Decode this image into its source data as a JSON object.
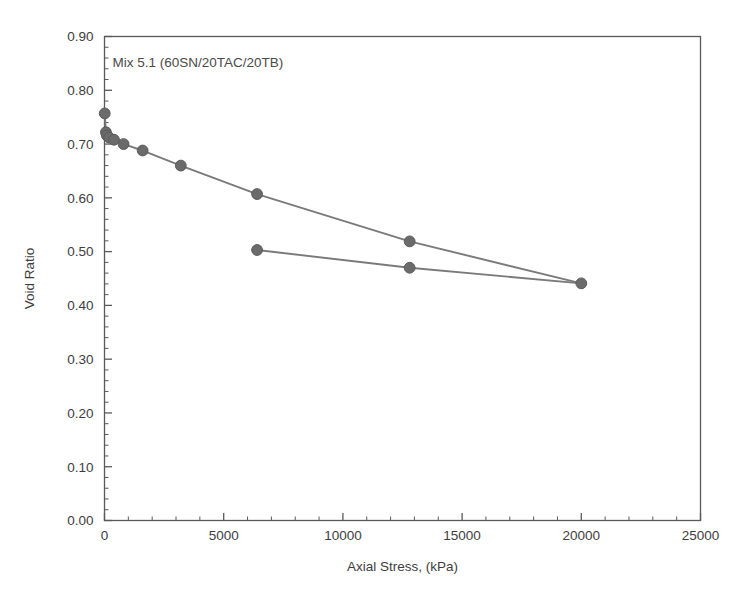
{
  "chart_data": {
    "type": "line",
    "title": "",
    "annotation": "Mix  5.1 (60SN/20TAC/20TB)",
    "xlabel": "Axial Stress, (kPa)",
    "ylabel": "Void Ratio",
    "xlim": [
      0,
      25000
    ],
    "ylim": [
      0.0,
      0.9
    ],
    "xticks": [
      0,
      5000,
      10000,
      15000,
      20000,
      25000
    ],
    "xtick_labels": [
      "0",
      "5000",
      "10000",
      "15000",
      "20000",
      "25000"
    ],
    "yticks": [
      0.0,
      0.1,
      0.2,
      0.3,
      0.4,
      0.5,
      0.6,
      0.7,
      0.8,
      0.9
    ],
    "ytick_labels": [
      "0.00",
      "0.10",
      "0.20",
      "0.30",
      "0.40",
      "0.50",
      "0.60",
      "0.70",
      "0.80",
      "0.90"
    ],
    "x_minor_step": 1000,
    "y_minor_step": 0.02,
    "grid": false,
    "legend": "none",
    "marker": "filled-circle",
    "marker_color": "#6b6b6b",
    "line_color": "#7a7a7a",
    "axis_color": "#595959",
    "series": [
      {
        "name": "Loading (compression)",
        "points": [
          {
            "x": 10,
            "y": 0.757
          },
          {
            "x": 60,
            "y": 0.722
          },
          {
            "x": 100,
            "y": 0.716
          },
          {
            "x": 200,
            "y": 0.712
          },
          {
            "x": 400,
            "y": 0.708
          },
          {
            "x": 800,
            "y": 0.7
          },
          {
            "x": 1600,
            "y": 0.688
          },
          {
            "x": 3200,
            "y": 0.66
          },
          {
            "x": 6400,
            "y": 0.607
          },
          {
            "x": 12800,
            "y": 0.519
          },
          {
            "x": 20000,
            "y": 0.441
          }
        ]
      },
      {
        "name": "Unloading (rebound)",
        "points": [
          {
            "x": 20000,
            "y": 0.441
          },
          {
            "x": 12800,
            "y": 0.47
          },
          {
            "x": 6400,
            "y": 0.503
          }
        ]
      }
    ]
  }
}
